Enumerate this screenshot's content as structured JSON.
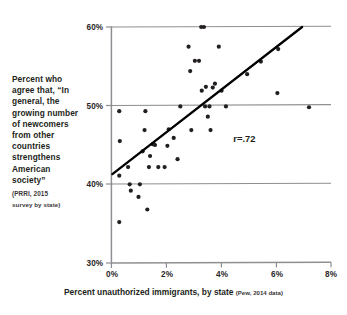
{
  "caption": {
    "text": "Percent who agree that, “In general, the growing number of newcomers from other countries strengthens American society”",
    "source_line1": "(PRRI, 2015",
    "source_line2": "survey by state)"
  },
  "xaxis": {
    "title": "Percent unauthorized immigrants, by state",
    "note": "(Pew, 2014 data)"
  },
  "annotation": {
    "r_label": "r=.72"
  },
  "ticks": {
    "y": [
      "60%",
      "50%",
      "40%",
      "30%"
    ],
    "x": [
      "0%",
      "2%",
      "4%",
      "6%",
      "8%"
    ]
  },
  "chart_data": {
    "type": "scatter",
    "title": "",
    "xlabel": "Percent unauthorized immigrants, by state (Pew, 2014 data)",
    "ylabel": "Percent who agree that, “In general, the growing number of newcomers from other countries strengthens American society” (PRRI, 2015 survey by state)",
    "xlim": [
      0,
      8
    ],
    "ylim": [
      30,
      60
    ],
    "xticks": [
      0,
      2,
      4,
      6,
      8
    ],
    "yticks": [
      30,
      40,
      50,
      60
    ],
    "xtick_labels": [
      "0%",
      "2%",
      "4%",
      "6%",
      "8%"
    ],
    "ytick_labels": [
      "30%",
      "40%",
      "50%",
      "60%"
    ],
    "grid": "horizontal",
    "legend": "none",
    "marker_color": "#231f20",
    "marker_size": 2.1,
    "annotations": [
      {
        "text": "r=.72",
        "x": 4.85,
        "y": 45.4
      }
    ],
    "trendline": {
      "type": "linear",
      "x": [
        0.05,
        6.95
      ],
      "y": [
        41.3,
        60.0
      ],
      "color": "#000000",
      "width": 2.3
    },
    "correlation": 0.72,
    "points": [
      {
        "x": 0.3,
        "y": 49.3
      },
      {
        "x": 0.32,
        "y": 45.5
      },
      {
        "x": 0.3,
        "y": 41.1
      },
      {
        "x": 0.3,
        "y": 35.2
      },
      {
        "x": 0.62,
        "y": 42.2
      },
      {
        "x": 0.68,
        "y": 40.0
      },
      {
        "x": 0.72,
        "y": 39.2
      },
      {
        "x": 1.0,
        "y": 38.4
      },
      {
        "x": 1.05,
        "y": 40.0
      },
      {
        "x": 1.15,
        "y": 44.2
      },
      {
        "x": 1.22,
        "y": 46.9
      },
      {
        "x": 1.25,
        "y": 49.3
      },
      {
        "x": 1.32,
        "y": 36.8
      },
      {
        "x": 1.38,
        "y": 42.2
      },
      {
        "x": 1.42,
        "y": 43.6
      },
      {
        "x": 1.52,
        "y": 45.1
      },
      {
        "x": 1.55,
        "y": 45.1
      },
      {
        "x": 1.6,
        "y": 45.0
      },
      {
        "x": 1.72,
        "y": 42.2
      },
      {
        "x": 1.95,
        "y": 42.2
      },
      {
        "x": 2.05,
        "y": 44.9
      },
      {
        "x": 2.1,
        "y": 47.0
      },
      {
        "x": 2.28,
        "y": 45.9
      },
      {
        "x": 2.42,
        "y": 43.2
      },
      {
        "x": 2.52,
        "y": 49.9
      },
      {
        "x": 2.82,
        "y": 57.5
      },
      {
        "x": 2.88,
        "y": 54.4
      },
      {
        "x": 2.92,
        "y": 46.9
      },
      {
        "x": 3.05,
        "y": 55.7
      },
      {
        "x": 3.2,
        "y": 55.7
      },
      {
        "x": 3.28,
        "y": 60.0
      },
      {
        "x": 3.38,
        "y": 60.0
      },
      {
        "x": 3.3,
        "y": 51.9
      },
      {
        "x": 3.42,
        "y": 49.9
      },
      {
        "x": 3.45,
        "y": 52.4
      },
      {
        "x": 3.52,
        "y": 48.6
      },
      {
        "x": 3.58,
        "y": 49.9
      },
      {
        "x": 3.7,
        "y": 52.3
      },
      {
        "x": 3.78,
        "y": 52.8
      },
      {
        "x": 3.62,
        "y": 46.9
      },
      {
        "x": 3.92,
        "y": 57.5
      },
      {
        "x": 4.02,
        "y": 51.9
      },
      {
        "x": 4.18,
        "y": 49.9
      },
      {
        "x": 4.95,
        "y": 54.0
      },
      {
        "x": 5.45,
        "y": 55.6
      },
      {
        "x": 6.05,
        "y": 51.6
      },
      {
        "x": 6.08,
        "y": 57.2
      },
      {
        "x": 7.2,
        "y": 49.8
      }
    ]
  },
  "plot_geometry": {
    "left_px": 111,
    "right_px": 331,
    "top_px": 27,
    "bottom_px": 263
  }
}
